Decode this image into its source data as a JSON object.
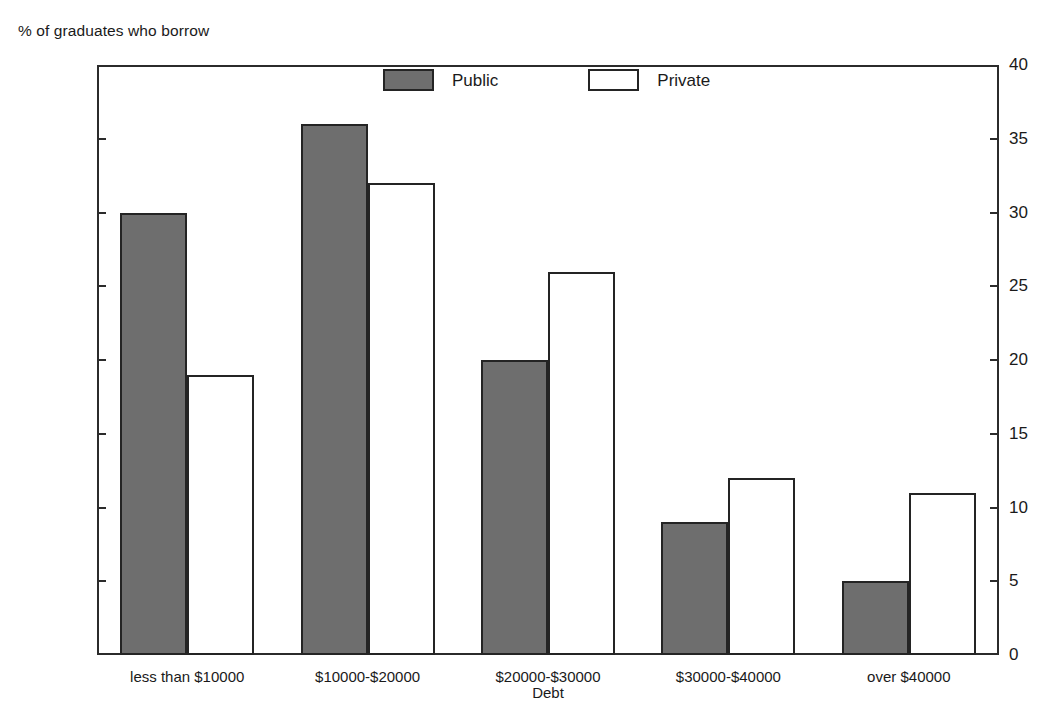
{
  "chart_data": {
    "type": "bar",
    "title": "",
    "subtitle": "",
    "ylabel": "% of graduates who borrow",
    "xlabel": "Debt",
    "categories": [
      "less than $10000",
      "$10000-$20000",
      "$20000-$30000",
      "$30000-$40000",
      "over $40000"
    ],
    "series": [
      {
        "name": "Public",
        "values": [
          30,
          36,
          20,
          9,
          5
        ]
      },
      {
        "name": "Private",
        "values": [
          19,
          32,
          26,
          12,
          11
        ]
      }
    ],
    "ylim": [
      0,
      40
    ],
    "yticks": [
      0,
      5,
      10,
      15,
      20,
      25,
      30,
      35,
      40
    ],
    "ytick_labels": [
      "0",
      "5",
      "10",
      "15",
      "20",
      "25",
      "30",
      "35",
      "40"
    ],
    "right_axis": {
      "ylim": [
        0,
        40
      ],
      "yticks": [
        0,
        5,
        10,
        15,
        20,
        25,
        30,
        35,
        40
      ],
      "ytick_labels": [
        "0",
        "5",
        "10",
        "15",
        "20",
        "25",
        "30",
        "35",
        "40"
      ]
    },
    "grid": false,
    "legend": {
      "position": "top-center-inside",
      "entries": [
        {
          "label": "Public",
          "color": "#6e6e6e",
          "border": "#242424"
        },
        {
          "label": "Private",
          "color": "#ffffff",
          "border": "#242424"
        }
      ]
    },
    "colors": {
      "public_fill": "#6e6e6e",
      "private_fill": "#ffffff",
      "bar_outline": "#242424",
      "axis": "#2b2b2b",
      "text": "#1a1a1a",
      "background": "#ffffff"
    }
  }
}
